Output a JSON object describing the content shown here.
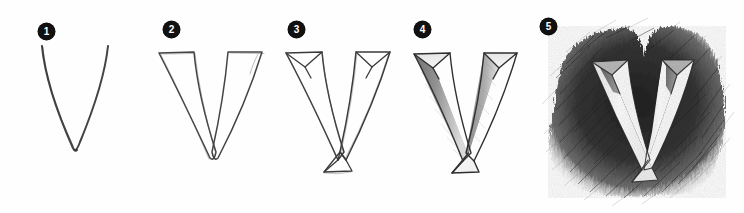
{
  "page": {
    "background_color": "#fefefe",
    "ink_color": "#2b2b2b",
    "badge_color": "#111111",
    "badge_text_color": "#ffffff",
    "width": 744,
    "height": 213,
    "medium": "graphite pencil on white paper",
    "subject_letter": "V"
  },
  "steps": [
    {
      "number": "1",
      "name": "skeleton-line-v",
      "description": "Thin single-line V skeleton sketch",
      "badge_x": 38,
      "badge_y": 23,
      "art_x": 20,
      "art_y": 38,
      "shaded": false,
      "outlined": false,
      "beveled": false,
      "background_scribble": false
    },
    {
      "number": "2",
      "name": "outlined-v",
      "description": "V given thickness with a double outline",
      "badge_x": 163,
      "badge_y": 21,
      "art_x": 146,
      "art_y": 34,
      "shaded": false,
      "outlined": true,
      "beveled": false,
      "background_scribble": false
    },
    {
      "number": "3",
      "name": "beveled-v",
      "description": "Bevel facet lines added at top ends and bottom vertex",
      "badge_x": 288,
      "badge_y": 21,
      "art_x": 272,
      "art_y": 34,
      "shaded": false,
      "outlined": true,
      "beveled": true,
      "background_scribble": false
    },
    {
      "number": "4",
      "name": "shaded-v",
      "description": "Graphite shading applied to the outer facets of both strokes",
      "badge_x": 414,
      "badge_y": 21,
      "art_x": 398,
      "art_y": 34,
      "shaded": true,
      "outlined": true,
      "beveled": true,
      "background_scribble": false
    },
    {
      "number": "5",
      "name": "scribbled-background-v",
      "description": "Dark scribbled pencil background with white highlighted 3D letter",
      "badge_x": 540,
      "badge_y": 18,
      "art_x": 520,
      "art_y": 12,
      "shaded": true,
      "outlined": true,
      "beveled": true,
      "background_scribble": true
    }
  ]
}
